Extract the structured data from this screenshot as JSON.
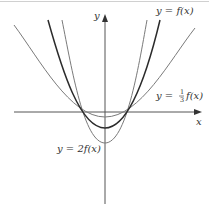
{
  "diagram": {
    "colors": {
      "background": "#ffffff",
      "axis": "#555555",
      "f_curve": "#2b2b2b",
      "scaled_curves": "#7a7a7a",
      "frame": "#d0d0d0"
    },
    "axes": {
      "x_label": "x",
      "y_label": "y"
    },
    "curves": [
      {
        "id": "f",
        "label": "y = f(x)",
        "style": "dark, thick"
      },
      {
        "id": "one_third_f",
        "label_prefix": "y = ",
        "frac_num": "1",
        "frac_den": "3",
        "label_suffix": "f(x)",
        "style": "gray"
      },
      {
        "id": "two_f",
        "label": "y = 2f(x)",
        "style": "gray"
      }
    ],
    "labels": {
      "f": "y = f(x)",
      "one_third_prefix": "y =",
      "one_third_num": "1",
      "one_third_den": "3",
      "one_third_suffix": "f(x)",
      "two_f": "y = 2f(x)"
    }
  }
}
